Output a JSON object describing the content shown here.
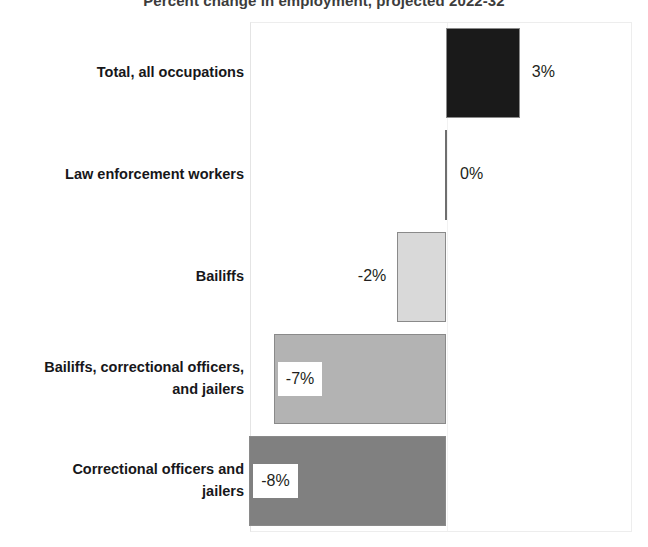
{
  "chart_data": {
    "type": "bar",
    "orientation": "horizontal",
    "title": "Percent change in employment, projected 2022-32",
    "xlabel": "",
    "ylabel": "",
    "grid": false,
    "legend": "none",
    "zero_axis_value": 0,
    "xlim": [
      -8,
      3
    ],
    "categories": [
      "Total, all occupations",
      "Law enforcement workers",
      "Bailiffs",
      "Bailiffs, correctional officers, and jailers",
      "Correctional officers and jailers"
    ],
    "values": [
      3,
      0,
      -2,
      -7,
      -8
    ],
    "value_labels": [
      "3%",
      "0%",
      "-2%",
      "-7%",
      "-8%"
    ],
    "colors": [
      "#1a1a1a",
      "#6f6f6f",
      "#d9d9d9",
      "#b3b3b3",
      "#808080"
    ]
  },
  "chart": {
    "title": "Percent change in employment, projected 2022-32",
    "bars": [
      {
        "category_lines": [
          "Total, all occupations"
        ],
        "value": 3,
        "label": "3%",
        "color": "#1a1a1a",
        "label_style": "outside-right"
      },
      {
        "category_lines": [
          "Law enforcement workers"
        ],
        "value": 0,
        "label": "0%",
        "color": "#6f6f6f",
        "label_style": "outside-right"
      },
      {
        "category_lines": [
          "Bailiffs"
        ],
        "value": -2,
        "label": "-2%",
        "color": "#d9d9d9",
        "label_style": "outside-left"
      },
      {
        "category_lines": [
          "Bailiffs, correctional officers,",
          "and jailers"
        ],
        "value": -7,
        "label": "-7%",
        "color": "#b3b3b3",
        "label_style": "boxed"
      },
      {
        "category_lines": [
          "Correctional officers and",
          "jailers"
        ],
        "value": -8,
        "label": "-8%",
        "color": "#808080",
        "label_style": "boxed"
      }
    ]
  }
}
